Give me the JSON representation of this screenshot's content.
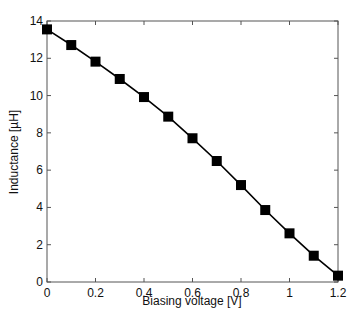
{
  "chart_data": {
    "type": "line",
    "title": "",
    "xlabel": "Biasing voltage [V]",
    "ylabel": "Inductance [µH]",
    "xlim": [
      0,
      1.2
    ],
    "ylim": [
      0,
      14
    ],
    "xticks": [
      0,
      0.2,
      0.4,
      0.6,
      0.8,
      1,
      1.2
    ],
    "xtick_labels": [
      "0",
      "0.2",
      "0.4",
      "0.6",
      "0.8",
      "1",
      "1.2"
    ],
    "yticks": [
      0,
      2,
      4,
      6,
      8,
      10,
      12,
      14
    ],
    "ytick_labels": [
      "0",
      "2",
      "4",
      "6",
      "8",
      "10",
      "12",
      "14"
    ],
    "grid": false,
    "legend": null,
    "marker": "square",
    "series": [
      {
        "name": "Inductance",
        "color": "#000000",
        "x": [
          0,
          0.1,
          0.2,
          0.3,
          0.4,
          0.5,
          0.6,
          0.7,
          0.8,
          0.9,
          1.0,
          1.1,
          1.2
        ],
        "values": [
          13.55,
          12.71,
          11.82,
          10.89,
          9.92,
          8.87,
          7.71,
          6.49,
          5.2,
          3.86,
          2.61,
          1.41,
          0.34
        ]
      }
    ]
  }
}
